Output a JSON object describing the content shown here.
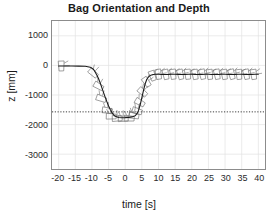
{
  "chart_data": {
    "type": "line",
    "title": "Bag Orientation and Depth",
    "xlabel": "time [s]",
    "ylabel": "z [mm]",
    "xlim": [
      -22,
      42
    ],
    "ylim": [
      -3500,
      1500
    ],
    "xticks": [
      -20,
      -15,
      -10,
      -5,
      0,
      5,
      10,
      15,
      20,
      25,
      30,
      35,
      40
    ],
    "xticklabels": [
      "-20",
      "-15",
      "-10",
      "-5",
      "0",
      "5",
      "10",
      "15",
      "20",
      "25",
      "30",
      "35",
      "40"
    ],
    "yticks": [
      1000,
      0,
      -1000,
      -2000,
      -3000
    ],
    "yticklabels": [
      "1000",
      "0",
      "-1000",
      "-2000",
      "-3000"
    ],
    "grid": true,
    "legend": "none",
    "series": [
      {
        "name": "depth z",
        "color": "#1a1a1a",
        "x": [
          -20.0,
          -18.0,
          -16.0,
          -14.0,
          -12.0,
          -10.5,
          -9.5,
          -9.0,
          -8.5,
          -8.0,
          -7.5,
          -7.0,
          -6.5,
          -6.0,
          -5.5,
          -5.0,
          -4.5,
          -4.0,
          -3.5,
          -3.0,
          -2.0,
          -1.0,
          0.0,
          1.0,
          2.0,
          3.0,
          3.5,
          4.0,
          4.5,
          5.0,
          5.5,
          6.0,
          6.5,
          7.0,
          7.5,
          8.0,
          8.5,
          9.0,
          10.0,
          11.0,
          12.0,
          13.0,
          14.0,
          15.0,
          16.0,
          17.0,
          18.0,
          19.0,
          20.0,
          21.0,
          22.0,
          23.0,
          24.0,
          25.0,
          26.0,
          27.0,
          28.0,
          29.0,
          30.0,
          31.0,
          32.0,
          33.0,
          34.0,
          35.0,
          36.0,
          37.0,
          38.0,
          39.0,
          40.0
        ],
        "y": [
          -20,
          -20,
          -20,
          -25,
          -30,
          -60,
          -140,
          -230,
          -330,
          -450,
          -600,
          -760,
          -920,
          -1080,
          -1230,
          -1370,
          -1490,
          -1590,
          -1670,
          -1720,
          -1760,
          -1770,
          -1765,
          -1755,
          -1740,
          -1700,
          -1640,
          -1520,
          -1330,
          -1090,
          -840,
          -620,
          -470,
          -390,
          -345,
          -320,
          -305,
          -300,
          -300,
          -305,
          -310,
          -305,
          -300,
          -300,
          -305,
          -310,
          -305,
          -300,
          -300,
          -305,
          -310,
          -305,
          -300,
          -300,
          -305,
          -310,
          -305,
          -300,
          -300,
          -305,
          -310,
          -305,
          -300,
          -300,
          -305,
          -310,
          -305,
          -300,
          -300
        ]
      }
    ],
    "reference_line": {
      "name": "target depth",
      "style": "dotted",
      "color": "#3a3a3a",
      "y": -1570
    },
    "markers": {
      "name": "bag orientation glyphs",
      "description": "small quadrilateral bag outlines with orientation stems plotted along the trajectory",
      "color": "#6b6b6b",
      "points": [
        {
          "x": -19.2,
          "y": -20,
          "angle": 88
        },
        {
          "x": -9.6,
          "y": -260,
          "angle": 42
        },
        {
          "x": -8.0,
          "y": -700,
          "angle": 30
        },
        {
          "x": -7.2,
          "y": -1120,
          "angle": 20
        },
        {
          "x": -5.4,
          "y": -1520,
          "angle": 8
        },
        {
          "x": -4.2,
          "y": -1720,
          "angle": 2
        },
        {
          "x": -2.4,
          "y": -1790,
          "angle": -2
        },
        {
          "x": -0.6,
          "y": -1800,
          "angle": 0
        },
        {
          "x": 1.2,
          "y": -1790,
          "angle": 3
        },
        {
          "x": 2.6,
          "y": -1700,
          "angle": 10
        },
        {
          "x": 3.6,
          "y": -1540,
          "angle": 18
        },
        {
          "x": 4.4,
          "y": -1250,
          "angle": 30
        },
        {
          "x": 5.2,
          "y": -900,
          "angle": 42
        },
        {
          "x": 6.4,
          "y": -560,
          "angle": 55
        },
        {
          "x": 8.2,
          "y": -350,
          "angle": 70
        },
        {
          "x": 10.0,
          "y": -300,
          "angle": 80
        },
        {
          "x": 12.2,
          "y": -305,
          "angle": 78
        },
        {
          "x": 14.4,
          "y": -300,
          "angle": 82
        },
        {
          "x": 16.6,
          "y": -305,
          "angle": 76
        },
        {
          "x": 18.8,
          "y": -300,
          "angle": 84
        },
        {
          "x": 21.0,
          "y": -305,
          "angle": 80
        },
        {
          "x": 23.2,
          "y": -300,
          "angle": 77
        },
        {
          "x": 25.4,
          "y": -305,
          "angle": 83
        },
        {
          "x": 27.6,
          "y": -300,
          "angle": 79
        },
        {
          "x": 29.8,
          "y": -305,
          "angle": 81
        },
        {
          "x": 32.0,
          "y": -300,
          "angle": 75
        },
        {
          "x": 34.2,
          "y": -305,
          "angle": 84
        },
        {
          "x": 36.4,
          "y": -300,
          "angle": 78
        },
        {
          "x": 38.6,
          "y": -305,
          "angle": 82
        }
      ]
    }
  }
}
